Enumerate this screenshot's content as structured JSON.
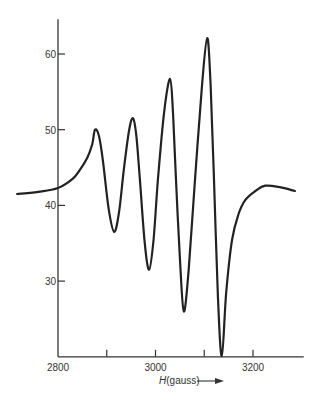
{
  "chart_data": {
    "type": "line",
    "title": "",
    "xlabel": "H(gauss)",
    "xlabel_italic_part": "H",
    "xlabel_rest": "(gauss)",
    "ylabel": "",
    "xlim": [
      2800,
      3300
    ],
    "ylim": [
      20,
      64.6
    ],
    "grid": false,
    "legend": "none",
    "x_ticks": [
      2800,
      2900,
      3000,
      3100,
      3200
    ],
    "x_tick_labels": [
      "2800",
      "",
      "3000",
      "",
      "3200"
    ],
    "y_ticks": [
      30,
      40,
      50,
      60
    ],
    "y_tick_labels": [
      "30",
      "40",
      "50",
      "60"
    ],
    "line_color": "#222222",
    "series": [
      {
        "name": "ESR spectrum",
        "x": [
          2716,
          2760,
          2800,
          2830,
          2845,
          2860,
          2870,
          2876,
          2884,
          2892,
          2904,
          2915,
          2925,
          2935,
          2946,
          2954,
          2961,
          2968,
          2978,
          2987,
          2996,
          3005,
          3018,
          3030,
          3036,
          3042,
          3050,
          3058,
          3068,
          3081,
          3095,
          3106,
          3113,
          3120,
          3128,
          3136,
          3145,
          3157,
          3170,
          3184,
          3205,
          3225,
          3255,
          3286
        ],
        "y": [
          41.5,
          41.8,
          42.3,
          43.5,
          44.7,
          46.3,
          48.0,
          50.0,
          49.2,
          46.0,
          39.5,
          36.5,
          39.0,
          44.7,
          50.0,
          51.5,
          49.0,
          43.4,
          35.0,
          31.5,
          35.5,
          43.4,
          52.5,
          56.7,
          52.0,
          43.4,
          33.0,
          26.0,
          31.5,
          43.4,
          55.5,
          62.1,
          56.0,
          43.4,
          28.0,
          20.1,
          28.5,
          35.4,
          38.8,
          40.7,
          41.9,
          42.6,
          42.4,
          41.9
        ]
      }
    ]
  }
}
